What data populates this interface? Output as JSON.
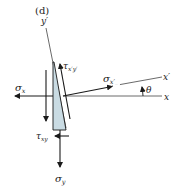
{
  "figure": {
    "panel_label": "(d)",
    "axes": {
      "x_label": "x",
      "x_prime_label": "x′",
      "y_prime_label": "y′",
      "angle_label": "θ"
    },
    "stresses": {
      "sigma_x": {
        "symbol": "σ",
        "sub": "x"
      },
      "sigma_y": {
        "symbol": "σ",
        "sub": "y"
      },
      "sigma_x_prime": {
        "symbol": "σ",
        "sub": "x′"
      },
      "tau_xy": {
        "symbol": "τ",
        "sub": "xy"
      },
      "tau_x_prime_y_prime": {
        "symbol": "τ",
        "sub": "x′y′"
      }
    },
    "colors": {
      "line": "#1a1a1a",
      "wedge_fill": "#c9dbe3",
      "axis_line": "#444444"
    }
  }
}
